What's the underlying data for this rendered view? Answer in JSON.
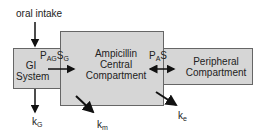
{
  "diagram": {
    "input_label": "oral intake",
    "gi": {
      "line1": "GI",
      "line2": "System"
    },
    "central": {
      "line1": "Ampicillin",
      "line2": "Central",
      "line3": "Compartment"
    },
    "peripheral": {
      "line1": "Peripheral",
      "line2": "Compartment"
    },
    "transfer_gi": {
      "p": "P",
      "p_sub": "AG",
      "s": "S",
      "s_sub": "G"
    },
    "transfer_periph": {
      "p": "P",
      "p_sub": "A",
      "s": "S"
    },
    "rates": {
      "kG": {
        "k": "k",
        "sub": "G"
      },
      "km": {
        "k": "k",
        "sub": "m"
      },
      "ke": {
        "k": "k",
        "sub": "e"
      }
    },
    "colors": {
      "box_fill": "#d6d6d6",
      "border": "#666666",
      "arrow": "#111111"
    }
  }
}
